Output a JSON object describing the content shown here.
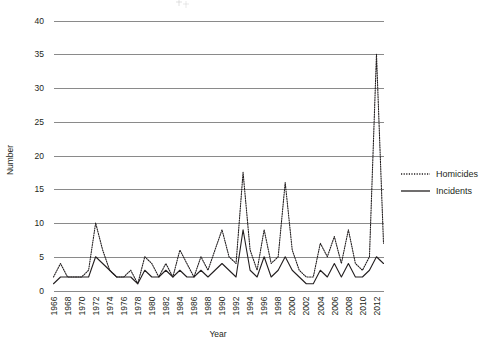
{
  "chart_data": {
    "type": "line",
    "title": "",
    "xlabel": "Year",
    "ylabel": "Number",
    "ylim": [
      0,
      40
    ],
    "ytick_step": 5,
    "yticks": [
      0,
      5,
      10,
      15,
      20,
      25,
      30,
      35,
      40
    ],
    "grid": true,
    "grid_axis": "y",
    "legend_position": "right",
    "xlim": [
      1966,
      2013
    ],
    "xtick_step": 2,
    "xtick_labels": [
      "1966",
      "1968",
      "1970",
      "1972",
      "1974",
      "1976",
      "1978",
      "1980",
      "1982",
      "1984",
      "1986",
      "1988",
      "1990",
      "1992",
      "1994",
      "1996",
      "1998",
      "2000",
      "2002",
      "2004",
      "2006",
      "2008",
      "2010",
      "2012"
    ],
    "x": [
      1966,
      1967,
      1968,
      1969,
      1970,
      1971,
      1972,
      1973,
      1974,
      1975,
      1976,
      1977,
      1978,
      1979,
      1980,
      1981,
      1982,
      1983,
      1984,
      1985,
      1986,
      1987,
      1988,
      1989,
      1990,
      1991,
      1992,
      1993,
      1994,
      1995,
      1996,
      1997,
      1998,
      1999,
      2000,
      2001,
      2002,
      2003,
      2004,
      2005,
      2006,
      2007,
      2008,
      2009,
      2010,
      2011,
      2012,
      2013
    ],
    "series": [
      {
        "name": "Homicides",
        "style": "dotted",
        "color": "#231f20",
        "values": [
          2,
          4,
          2,
          2,
          2,
          3,
          10,
          6,
          3,
          2,
          2,
          3,
          1,
          5,
          4,
          2,
          4,
          2,
          6,
          4,
          2,
          5,
          3,
          6,
          9,
          5,
          4,
          17.5,
          6,
          3,
          9,
          4,
          5,
          16,
          6,
          3,
          2,
          2,
          7,
          5,
          8,
          4,
          9,
          4,
          3,
          5,
          35,
          7
        ]
      },
      {
        "name": "Incidents",
        "style": "solid",
        "color": "#231f20",
        "values": [
          1,
          2,
          2,
          2,
          2,
          2,
          5,
          4,
          3,
          2,
          2,
          2,
          1,
          3,
          2,
          2,
          3,
          2,
          3,
          2,
          2,
          3,
          2,
          3,
          4,
          3,
          2,
          9,
          3,
          2,
          5,
          2,
          3,
          5,
          3,
          2,
          1,
          1,
          3,
          2,
          4,
          2,
          4,
          2,
          2,
          3,
          5,
          4
        ]
      }
    ]
  },
  "legend": {
    "items": [
      {
        "label": "Homicides",
        "style": "dotted"
      },
      {
        "label": "Incidents",
        "style": "solid"
      }
    ]
  },
  "axes": {
    "y_title": "Number",
    "x_title": "Year"
  }
}
